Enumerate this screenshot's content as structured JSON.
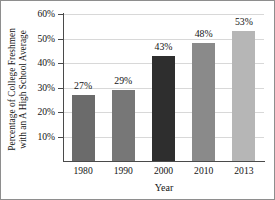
{
  "chart_data": {
    "type": "bar",
    "title": "",
    "xlabel": "Year",
    "ylabel_lines": [
      "Percentage of College Freshmen",
      "with an A High School Average"
    ],
    "ylabel": "Percentage of College Freshmen with an A High School Average",
    "categories": [
      "1980",
      "1990",
      "2000",
      "2010",
      "2013"
    ],
    "values": [
      27,
      29,
      43,
      48,
      53
    ],
    "value_labels": [
      "27%",
      "29%",
      "43%",
      "48%",
      "53%"
    ],
    "yticks": [
      10,
      20,
      30,
      40,
      50,
      60
    ],
    "ytick_labels": [
      "10%",
      "20%",
      "30%",
      "40%",
      "50%",
      "60%"
    ],
    "ylim": [
      0,
      60
    ],
    "grid": "horizontal",
    "legend": "none",
    "bar_colors": [
      "#6b6b6b",
      "#777777",
      "#2e2e2e",
      "#8a8a8a",
      "#b6b6b6"
    ],
    "gridline_color": "#d8d8d8",
    "axis_color": "#4a4a4a",
    "text_color": "#141414",
    "background": "#ffffff",
    "border_color": "#8e8e8e"
  }
}
